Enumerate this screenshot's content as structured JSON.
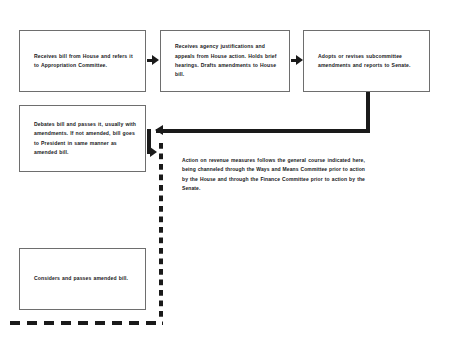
{
  "diagram": {
    "line_color": "#1a1a1a",
    "box_border_color": "#6e6e6e",
    "background": "#ffffff",
    "boxes": [
      {
        "id": "appropriation-committee",
        "text": "Receives bill from House and refers it to Appropriation Committee."
      },
      {
        "id": "subcommittee-hearings",
        "text": "Receives agency justifications and appeals from House action. Holds brief hearings. Drafts amendments to House bill."
      },
      {
        "id": "full-committee-report",
        "text": "Adopts or revises subcommittee amendments and reports to Senate."
      },
      {
        "id": "senate-debate",
        "text": "Debates bill and passes it, usually with amendments. If not amended, bill goes to President in same manner as amended bill."
      },
      {
        "id": "house-considers",
        "text": "Considers and passes amended bill."
      }
    ],
    "note": {
      "lead": "Action on revenue measures follows ",
      "emphasis": "the general course indicated here",
      "tail": ", being channeled through the Ways and Means Committee prior to action by the House and through the Finance Committee prior to action by the Senate."
    }
  }
}
